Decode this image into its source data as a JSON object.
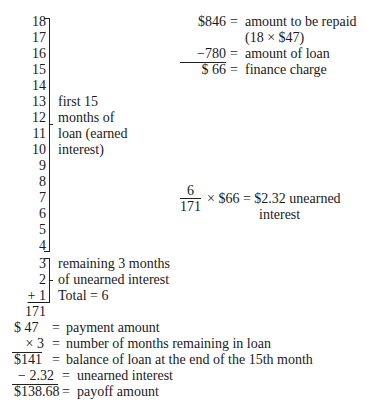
{
  "countdown": {
    "numbers": [
      "18",
      "17",
      "16",
      "15",
      "14",
      "13",
      "12",
      "11",
      "10",
      "9",
      "8",
      "7",
      "6",
      "5",
      "4",
      "3",
      "2",
      "+ 1"
    ],
    "sum": "171"
  },
  "bracket_earned": {
    "lines": [
      "first 15",
      "months of",
      "loan (earned",
      "interest)"
    ]
  },
  "bracket_unearned": {
    "lines": [
      "remaining 3 months",
      "of unearned interest",
      "Total = 6"
    ]
  },
  "finance_calc": {
    "rows": [
      {
        "amount": "$846",
        "eq": "=",
        "label": "amount to be repaid"
      },
      {
        "amount": "",
        "eq": "",
        "label": "(18 × $47)"
      },
      {
        "amount": "−780",
        "eq": "=",
        "label": "amount of loan"
      },
      {
        "amount": "$ 66",
        "eq": "=",
        "label": "finance charge"
      }
    ]
  },
  "unearned_calc": {
    "numerator": "6",
    "denominator": "171",
    "expr": "× $66 = $2.32 unearned",
    "expr_line2": "interest"
  },
  "payoff_calc": {
    "rows": [
      {
        "amount": "$ 47",
        "eq": "=",
        "label": "payment amount"
      },
      {
        "amount": "× 3",
        "eq": "=",
        "label": "number of months remaining in loan"
      },
      {
        "amount": "$141",
        "eq": "=",
        "label": "balance of loan at the end of the 15th month"
      },
      {
        "amount": "− 2.32",
        "eq": "=",
        "label": "unearned interest"
      },
      {
        "amount": "$138.68",
        "eq": "=",
        "label": "payoff amount"
      }
    ]
  }
}
